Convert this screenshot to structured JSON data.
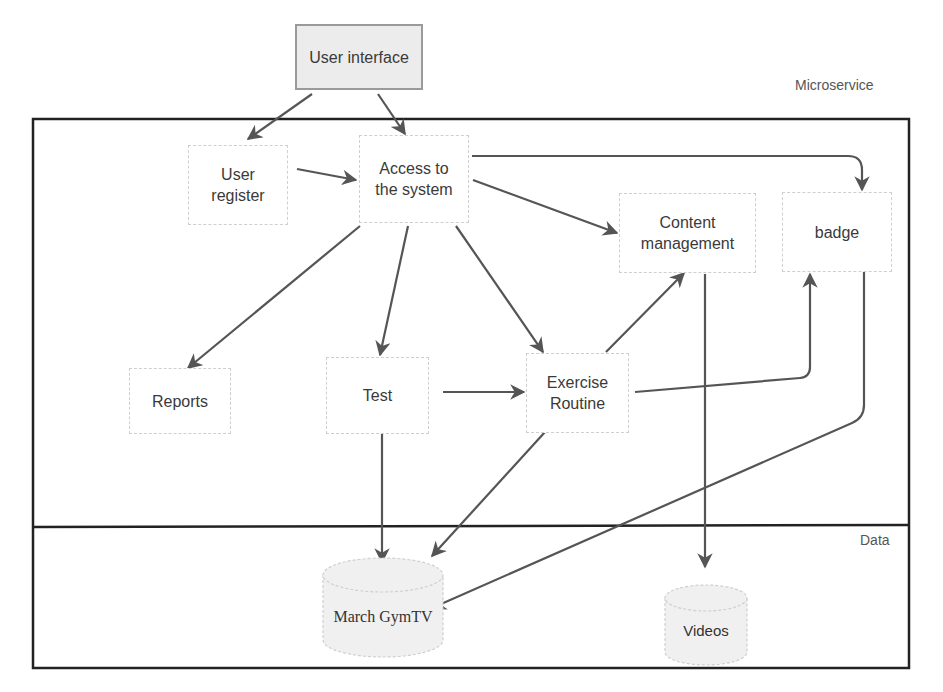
{
  "diagram": {
    "lanes": {
      "microservice": "Microservice",
      "data": "Data"
    },
    "nodes": {
      "user_interface": "User interface",
      "user_register": "User\nregister",
      "access_system": "Access to\nthe system",
      "content_management": "Content\nmanagement",
      "badge": "badge",
      "reports": "Reports",
      "test": "Test",
      "exercise_routine": "Exercise\nRoutine"
    },
    "databases": {
      "march_gymtv": "March GymTV",
      "videos": "Videos"
    },
    "edges": [
      {
        "from": "User interface",
        "to": "User register"
      },
      {
        "from": "User interface",
        "to": "Access to the system"
      },
      {
        "from": "User register",
        "to": "Access to the system"
      },
      {
        "from": "Access to the system",
        "to": "badge"
      },
      {
        "from": "Access to the system",
        "to": "Content management"
      },
      {
        "from": "Access to the system",
        "to": "Reports"
      },
      {
        "from": "Access to the system",
        "to": "Test"
      },
      {
        "from": "Access to the system",
        "to": "Exercise Routine"
      },
      {
        "from": "Test",
        "to": "Exercise Routine"
      },
      {
        "from": "Exercise Routine",
        "to": "Content management"
      },
      {
        "from": "Exercise Routine",
        "to": "badge"
      },
      {
        "from": "Test",
        "to": "March GymTV"
      },
      {
        "from": "Exercise Routine",
        "to": "March GymTV"
      },
      {
        "from": "badge",
        "to": "March GymTV"
      },
      {
        "from": "Content management",
        "to": "Videos"
      }
    ],
    "colors": {
      "edge": "#555555",
      "frame": "#222222",
      "ui_fill": "#ececec",
      "db_fill": "#f0f0f0"
    }
  }
}
